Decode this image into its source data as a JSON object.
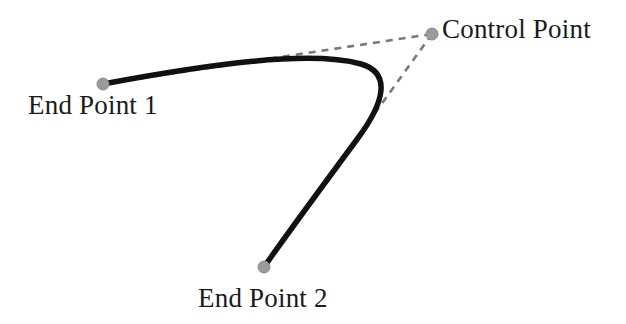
{
  "figure": {
    "background_color": "#ffffff",
    "width": 626,
    "height": 324
  },
  "labels": {
    "end_point_1": "End Point 1",
    "end_point_2": "End Point 2",
    "control_point": "Control Point"
  },
  "colors": {
    "curve": "#111111",
    "dashed_line": "#7a7a7a",
    "point_marker": "#9a9a9a",
    "point_marker_edge": "#8a8a8a",
    "text": "#1a1a1a"
  },
  "geometry": {
    "end_point_1": {
      "x": 103,
      "y": 84,
      "radius": 6
    },
    "end_point_2": {
      "x": 264,
      "y": 267,
      "radius": 6
    },
    "control_point": {
      "x": 432,
      "y": 34,
      "radius": 6
    },
    "curve_stroke_width": 5.5,
    "dash_stroke_width": 2.6,
    "dash_pattern": "7 6",
    "curve_path": "M 103 84 C 210 64 310 50 361 64 C 392 73 384 103 358 138 C 330 176 292 227 264 267",
    "tangent_line_1": "M 103 84 L 432 34",
    "tangent_line_2": "M 432 34 L 264 267"
  },
  "chart_data": {
    "type": "line",
    "xlabel": "",
    "ylabel": "",
    "annotations": [
      "End Point 1",
      "End Point 2",
      "Control Point"
    ],
    "series": [
      {
        "name": "bezier-curve",
        "kind": "quadratic-bezier",
        "points": [
          {
            "role": "start",
            "label": "End Point 1",
            "x": 103,
            "y": 84
          },
          {
            "role": "control",
            "label": "Control Point",
            "x": 432,
            "y": 34
          },
          {
            "role": "end",
            "label": "End Point 2",
            "x": 264,
            "y": 267
          }
        ]
      },
      {
        "name": "control-polygon",
        "kind": "dashed",
        "points": [
          {
            "label": "End Point 1",
            "x": 103,
            "y": 84
          },
          {
            "label": "Control Point",
            "x": 432,
            "y": 34
          },
          {
            "label": "End Point 2",
            "x": 264,
            "y": 267
          }
        ]
      }
    ]
  }
}
